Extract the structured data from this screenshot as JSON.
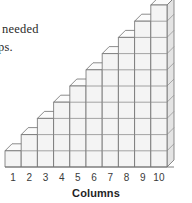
{
  "document_excerpt": {
    "line_1": "needed",
    "line_2": "ps."
  },
  "chart_data": {
    "type": "bar",
    "title": "",
    "subtitle": "",
    "xlabel": "Columns",
    "ylabel": "",
    "categories": [
      "1",
      "2",
      "3",
      "4",
      "5",
      "6",
      "7",
      "8",
      "9",
      "10"
    ],
    "values": [
      1,
      2,
      3,
      4,
      5,
      6,
      7,
      8,
      9,
      10
    ],
    "unit": "blocks",
    "ylim": [
      0,
      10
    ],
    "grid": true,
    "legend": false,
    "style": "isometric-3d-unit-cubes",
    "colors": {
      "cube_front": "#f4f4f4",
      "cube_top": "#fbfbfb",
      "cube_side": "#e4e4e4",
      "grid_line": "#8e8e8e",
      "outline": "#6f6f6f",
      "background": "#ffffff",
      "label_text": "#3a3a3a",
      "axis_title_text": "#1f1f1f",
      "body_text": "#2b2b2b"
    },
    "geometry": {
      "origin_x": 5,
      "baseline_y": 167,
      "cell_width": 16.2,
      "cell_height": 16.2,
      "depth_dx": 7,
      "depth_dy": -7
    }
  },
  "axis": {
    "tick_labels": [
      "1",
      "2",
      "3",
      "4",
      "5",
      "6",
      "7",
      "8",
      "9",
      "10"
    ],
    "title": "Columns"
  }
}
